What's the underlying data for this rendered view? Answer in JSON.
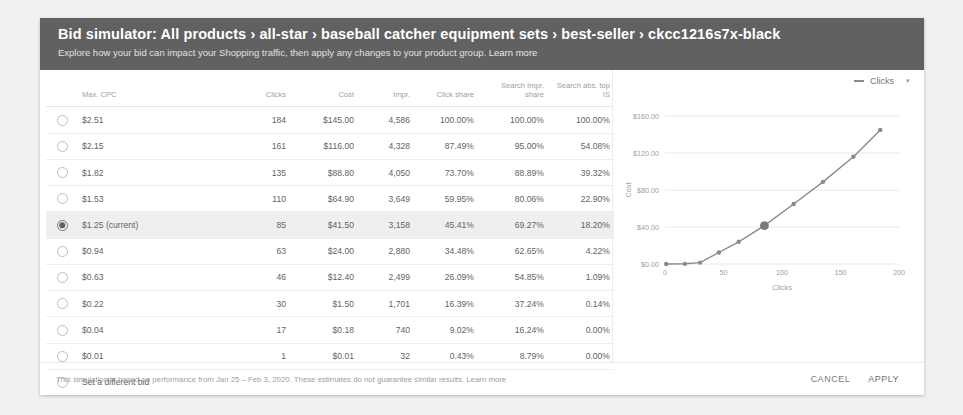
{
  "header": {
    "title": "Bid simulator: All products › all-star › baseball catcher equipment sets › best-seller › ckcc1216s7x-black",
    "subtitle": "Explore how your bid can impact your Shopping traffic, then apply any changes to your product group.",
    "learn_more": "Learn more"
  },
  "table": {
    "columns": [
      "Max. CPC",
      "Clicks",
      "Cost",
      "Impr.",
      "Click share",
      "Search Impr. share",
      "Search abs. top IS"
    ],
    "rows": [
      {
        "cpc": "$2.51",
        "clicks": "184",
        "cost": "$145.00",
        "impr": "4,586",
        "click_share": "100.00%",
        "search_impr_share": "100.00%",
        "search_abs_top": "100.00%",
        "selected": false
      },
      {
        "cpc": "$2.15",
        "clicks": "161",
        "cost": "$116.00",
        "impr": "4,328",
        "click_share": "87.49%",
        "search_impr_share": "95.00%",
        "search_abs_top": "54.08%",
        "selected": false
      },
      {
        "cpc": "$1.82",
        "clicks": "135",
        "cost": "$88.80",
        "impr": "4,050",
        "click_share": "73.70%",
        "search_impr_share": "88.89%",
        "search_abs_top": "39.32%",
        "selected": false
      },
      {
        "cpc": "$1.53",
        "clicks": "110",
        "cost": "$64.90",
        "impr": "3,649",
        "click_share": "59.95%",
        "search_impr_share": "80.06%",
        "search_abs_top": "22.90%",
        "selected": false
      },
      {
        "cpc": "$1.25 (current)",
        "clicks": "85",
        "cost": "$41.50",
        "impr": "3,158",
        "click_share": "45.41%",
        "search_impr_share": "69.27%",
        "search_abs_top": "18.20%",
        "selected": true
      },
      {
        "cpc": "$0.94",
        "clicks": "63",
        "cost": "$24.00",
        "impr": "2,880",
        "click_share": "34.48%",
        "search_impr_share": "62.65%",
        "search_abs_top": "4.22%",
        "selected": false
      },
      {
        "cpc": "$0.63",
        "clicks": "46",
        "cost": "$12.40",
        "impr": "2,499",
        "click_share": "26.09%",
        "search_impr_share": "54.85%",
        "search_abs_top": "1.09%",
        "selected": false
      },
      {
        "cpc": "$0.22",
        "clicks": "30",
        "cost": "$1.50",
        "impr": "1,701",
        "click_share": "16.39%",
        "search_impr_share": "37.24%",
        "search_abs_top": "0.14%",
        "selected": false
      },
      {
        "cpc": "$0.04",
        "clicks": "17",
        "cost": "$0.18",
        "impr": "740",
        "click_share": "9.02%",
        "search_impr_share": "16.24%",
        "search_abs_top": "0.00%",
        "selected": false
      },
      {
        "cpc": "$0.01",
        "clicks": "1",
        "cost": "$0.01",
        "impr": "32",
        "click_share": "0.43%",
        "search_impr_share": "8.79%",
        "search_abs_top": "0.00%",
        "selected": false
      }
    ],
    "set_different_bid": "Set a different bid"
  },
  "chart_panel": {
    "legend_label": "Clicks",
    "legend_caret": "▾"
  },
  "footer": {
    "note": "This simulation is based on performance from Jan 25 – Feb 3, 2020. These estimates do not guarantee similar results.",
    "learn_more": "Learn more",
    "cancel_label": "CANCEL",
    "apply_label": "APPLY"
  },
  "chart_data": {
    "type": "line",
    "title": "",
    "xlabel": "Clicks",
    "ylabel": "Cost",
    "xlim": [
      0,
      200
    ],
    "ylim": [
      0,
      160
    ],
    "xticks": [
      0,
      50,
      100,
      150,
      200
    ],
    "xticklabels": [
      "0",
      "50",
      "100",
      "150",
      "200"
    ],
    "yticks": [
      0,
      40,
      80,
      120,
      160
    ],
    "yticklabels": [
      "$0.00",
      "$40.00",
      "$80.00",
      "$120.00",
      "$160.00"
    ],
    "grid": true,
    "legend_position": "top-right",
    "series": [
      {
        "name": "Clicks",
        "color": "#8a8a8a",
        "x": [
          1,
          17,
          30,
          46,
          63,
          85,
          110,
          135,
          161,
          184
        ],
        "y": [
          0.01,
          0.18,
          1.5,
          12.4,
          24.0,
          41.5,
          64.9,
          88.8,
          116.0,
          145.0
        ]
      }
    ],
    "highlight_point": {
      "x": 85,
      "y": 41.5,
      "label": "current"
    }
  }
}
